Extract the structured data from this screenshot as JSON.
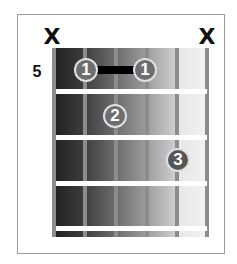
{
  "chord_diagram": {
    "start_fret_label": "5",
    "muted_strings": [
      {
        "string": 6,
        "symbol": "X"
      },
      {
        "string": 1,
        "symbol": "X"
      }
    ],
    "fingers": [
      {
        "label": "1",
        "string": 5,
        "fret": 1
      },
      {
        "label": "1",
        "string": 2,
        "fret": 1
      },
      {
        "label": "2",
        "string": 4,
        "fret": 2
      },
      {
        "label": "3",
        "string": 2,
        "fret": 3
      }
    ],
    "barre": {
      "finger": "1",
      "from_string": 5,
      "to_string": 2,
      "fret": 1
    },
    "strings": 6,
    "frets_shown": 4
  }
}
